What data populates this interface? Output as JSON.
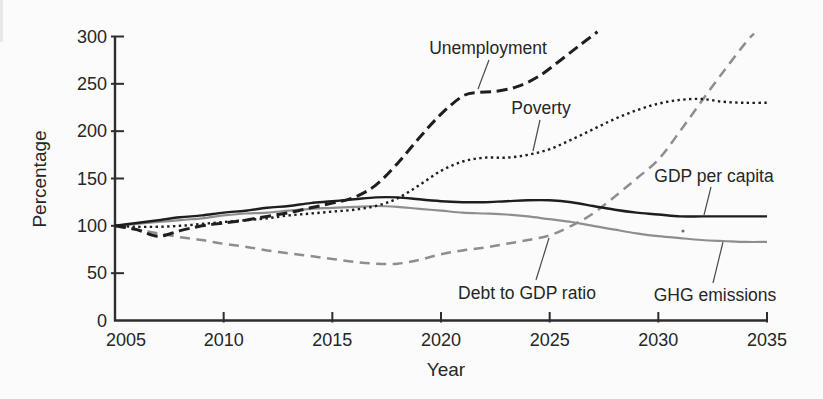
{
  "chart_data": {
    "type": "line",
    "title": "",
    "xlabel": "Year",
    "ylabel": "Percentage",
    "xlim": [
      2005,
      2035
    ],
    "ylim": [
      0,
      300
    ],
    "x_ticks": [
      2005,
      2010,
      2015,
      2020,
      2025,
      2030,
      2035
    ],
    "y_ticks": [
      0,
      50,
      100,
      150,
      200,
      250,
      300
    ],
    "grid": false,
    "legend_position": "none-inline-annotated-labels",
    "colors": {
      "black_line": "#1e1e1e",
      "gray_line": "#8e8e8e",
      "axis": "#2e2e2e",
      "text": "#262626",
      "leader_line": "#4a4a4a",
      "background": "#fbfbfb"
    },
    "series": [
      {
        "name": "Debt to GDP ratio",
        "line_style": "dashed",
        "color": "#8e8e8e",
        "stroke_width": 2.5,
        "stroke_dasharray": "10 6.5",
        "points": [
          [
            2005,
            100
          ],
          [
            2006,
            96
          ],
          [
            2007,
            92
          ],
          [
            2008,
            88
          ],
          [
            2009,
            85
          ],
          [
            2010,
            81
          ],
          [
            2011,
            78
          ],
          [
            2012,
            74
          ],
          [
            2013,
            71
          ],
          [
            2014,
            68
          ],
          [
            2015,
            65
          ],
          [
            2016,
            62
          ],
          [
            2017,
            60
          ],
          [
            2018,
            60
          ],
          [
            2019,
            64
          ],
          [
            2020,
            70
          ],
          [
            2021,
            74
          ],
          [
            2022,
            77
          ],
          [
            2023,
            81
          ],
          [
            2024,
            85
          ],
          [
            2025,
            90
          ],
          [
            2026,
            100
          ],
          [
            2027,
            113
          ],
          [
            2028,
            131
          ],
          [
            2029,
            150
          ],
          [
            2030,
            170
          ],
          [
            2031,
            200
          ],
          [
            2032,
            232
          ],
          [
            2033,
            263
          ],
          [
            2034,
            293
          ],
          [
            2034.4,
            303
          ]
        ]
      },
      {
        "name": "GHG emissions",
        "line_style": "solid",
        "color": "#8e8e8e",
        "stroke_width": 2.2,
        "stroke_dasharray": "",
        "points": [
          [
            2005,
            100
          ],
          [
            2006,
            102
          ],
          [
            2007,
            104
          ],
          [
            2008,
            106
          ],
          [
            2009,
            108
          ],
          [
            2010,
            111
          ],
          [
            2011,
            113
          ],
          [
            2012,
            114
          ],
          [
            2013,
            116
          ],
          [
            2014,
            118
          ],
          [
            2015,
            119
          ],
          [
            2016,
            120
          ],
          [
            2017,
            121
          ],
          [
            2018,
            120
          ],
          [
            2019,
            118
          ],
          [
            2020,
            116
          ],
          [
            2021,
            114
          ],
          [
            2022,
            113
          ],
          [
            2023,
            112
          ],
          [
            2024,
            110
          ],
          [
            2025,
            107
          ],
          [
            2026,
            104
          ],
          [
            2027,
            100
          ],
          [
            2028,
            96
          ],
          [
            2029,
            92
          ],
          [
            2030,
            89
          ],
          [
            2031,
            87
          ],
          [
            2032,
            85
          ],
          [
            2033,
            84
          ],
          [
            2034,
            83
          ],
          [
            2035,
            83
          ]
        ]
      },
      {
        "name": "Poverty",
        "line_style": "dotted",
        "color": "#1e1e1e",
        "stroke_width": 2.4,
        "stroke_dasharray": "2.4 3.4",
        "points": [
          [
            2005,
            100
          ],
          [
            2006,
            99
          ],
          [
            2007,
            99
          ],
          [
            2008,
            100
          ],
          [
            2009,
            102
          ],
          [
            2010,
            104
          ],
          [
            2011,
            106
          ],
          [
            2012,
            108
          ],
          [
            2013,
            111
          ],
          [
            2014,
            113
          ],
          [
            2015,
            115
          ],
          [
            2016,
            117
          ],
          [
            2017,
            121
          ],
          [
            2018,
            129
          ],
          [
            2019,
            143
          ],
          [
            2020,
            158
          ],
          [
            2021,
            168
          ],
          [
            2022,
            172
          ],
          [
            2023,
            172
          ],
          [
            2024,
            175
          ],
          [
            2025,
            181
          ],
          [
            2026,
            191
          ],
          [
            2027,
            202
          ],
          [
            2028,
            213
          ],
          [
            2029,
            222
          ],
          [
            2030,
            229
          ],
          [
            2031,
            233
          ],
          [
            2032,
            234
          ],
          [
            2033,
            231
          ],
          [
            2034,
            230
          ],
          [
            2035,
            230
          ]
        ]
      },
      {
        "name": "GDP per capita",
        "line_style": "solid",
        "color": "#1e1e1e",
        "stroke_width": 2.4,
        "stroke_dasharray": "",
        "points": [
          [
            2005,
            100
          ],
          [
            2006,
            103
          ],
          [
            2007,
            106
          ],
          [
            2008,
            109
          ],
          [
            2009,
            111
          ],
          [
            2010,
            114
          ],
          [
            2011,
            116
          ],
          [
            2012,
            119
          ],
          [
            2013,
            121
          ],
          [
            2014,
            124
          ],
          [
            2015,
            126
          ],
          [
            2016,
            128
          ],
          [
            2017,
            130
          ],
          [
            2018,
            130
          ],
          [
            2019,
            128
          ],
          [
            2020,
            126
          ],
          [
            2021,
            125
          ],
          [
            2022,
            125
          ],
          [
            2023,
            126
          ],
          [
            2024,
            127
          ],
          [
            2025,
            127
          ],
          [
            2026,
            125
          ],
          [
            2027,
            121
          ],
          [
            2028,
            117
          ],
          [
            2029,
            114
          ],
          [
            2030,
            112
          ],
          [
            2031,
            110
          ],
          [
            2032,
            110
          ],
          [
            2033,
            110
          ],
          [
            2034,
            110
          ],
          [
            2035,
            110
          ]
        ]
      },
      {
        "name": "Unemployment",
        "line_style": "dashed-bold",
        "color": "#1e1e1e",
        "stroke_width": 3,
        "stroke_dasharray": "11 5.5",
        "points": [
          [
            2005,
            100
          ],
          [
            2006,
            96
          ],
          [
            2007,
            89
          ],
          [
            2008,
            95
          ],
          [
            2009,
            100
          ],
          [
            2010,
            103
          ],
          [
            2011,
            106
          ],
          [
            2012,
            110
          ],
          [
            2013,
            114
          ],
          [
            2014,
            119
          ],
          [
            2015,
            124
          ],
          [
            2016,
            130
          ],
          [
            2017,
            143
          ],
          [
            2018,
            166
          ],
          [
            2019,
            193
          ],
          [
            2020,
            218
          ],
          [
            2021,
            237
          ],
          [
            2021.7,
            241
          ],
          [
            2022.5,
            242
          ],
          [
            2023.5,
            247
          ],
          [
            2024.5,
            258
          ],
          [
            2025.5,
            275
          ],
          [
            2026.4,
            291
          ],
          [
            2027.2,
            305
          ]
        ]
      }
    ],
    "annotations": [
      {
        "label": "Unemployment",
        "text_x": 488,
        "text_y": 48,
        "leader": [
          489,
          60,
          478,
          89
        ]
      },
      {
        "label": "Poverty",
        "text_x": 541,
        "text_y": 108,
        "leader": [
          540,
          120,
          533,
          151
        ]
      },
      {
        "label": "GDP per capita",
        "text_x": 714,
        "text_y": 176,
        "leader": [
          711,
          187,
          704,
          215
        ]
      },
      {
        "label": "Debt to GDP ratio",
        "text_x": 527,
        "text_y": 293,
        "leader": [
          536,
          280,
          549,
          238
        ]
      },
      {
        "label": "GHG emissions",
        "text_x": 715,
        "text_y": 295,
        "leader": [
          713,
          283,
          723,
          242
        ]
      }
    ]
  }
}
